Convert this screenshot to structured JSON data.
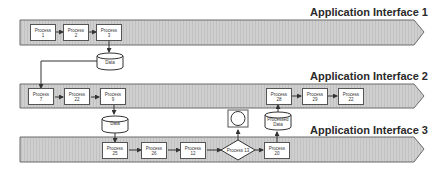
{
  "diagram": {
    "bands": [
      {
        "id": "band-1",
        "title": "Application Interface 1"
      },
      {
        "id": "band-2",
        "title": "Application Interface 2"
      },
      {
        "id": "band-3",
        "title": "Application Interface 3"
      }
    ],
    "processes": {
      "p1": {
        "label": "Process",
        "num": "1"
      },
      "p2": {
        "label": "Process",
        "num": "2"
      },
      "p3": {
        "label": "Process",
        "num": "3"
      },
      "p7": {
        "label": "Process",
        "num": "7"
      },
      "p22a": {
        "label": "Process",
        "num": "22"
      },
      "p9": {
        "label": "Process",
        "num": "9"
      },
      "p28": {
        "label": "Process",
        "num": "28"
      },
      "p29": {
        "label": "Process",
        "num": "29"
      },
      "p22b": {
        "label": "Process",
        "num": "22"
      },
      "p25": {
        "label": "Process",
        "num": "25"
      },
      "p26": {
        "label": "Process",
        "num": "26"
      },
      "p12": {
        "label": "Process",
        "num": "12"
      },
      "p20": {
        "label": "Process",
        "num": "20"
      }
    },
    "decision": {
      "label": "Process 13"
    },
    "data_stores": {
      "data1": {
        "label": "Data"
      },
      "data2": {
        "label": "Data"
      },
      "processed": {
        "line1": "Processed",
        "line2": "Data"
      }
    },
    "colors": {
      "band_fill": "#c8c8c8",
      "band_stroke": "#6a6a6a",
      "box_fill": "#ffffff",
      "line": "#333333"
    }
  }
}
